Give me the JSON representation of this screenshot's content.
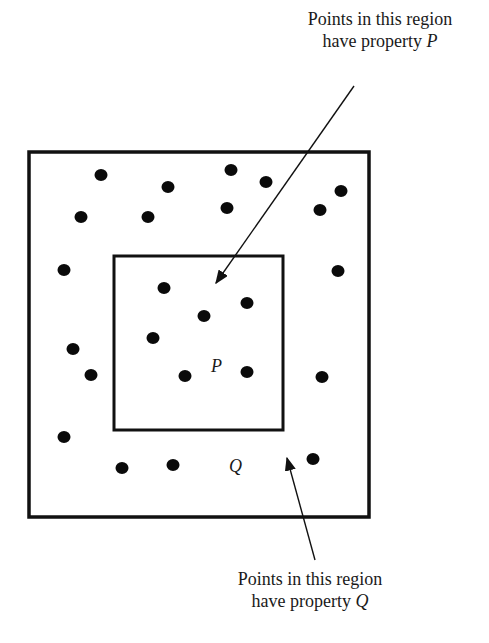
{
  "diagram": {
    "top_label": {
      "line1": "Points in this region",
      "line2_prefix": "have property ",
      "line2_var": "P"
    },
    "bottom_label": {
      "line1": "Points in this region",
      "line2_prefix": "have property ",
      "line2_var": "Q"
    },
    "inner_region_letter": "P",
    "outer_region_letter": "Q",
    "outer_box": {
      "x": 29,
      "y": 152,
      "w": 340,
      "h": 365
    },
    "inner_box": {
      "x": 114,
      "y": 256,
      "w": 169,
      "h": 174
    },
    "inner_points": [
      [
        164,
        288
      ],
      [
        204,
        316
      ],
      [
        247,
        303
      ],
      [
        153,
        338
      ],
      [
        185,
        376
      ],
      [
        247,
        372
      ]
    ],
    "outer_points": [
      [
        101,
        175
      ],
      [
        168,
        187
      ],
      [
        231,
        170
      ],
      [
        266,
        182
      ],
      [
        341,
        191
      ],
      [
        81,
        217
      ],
      [
        148,
        217
      ],
      [
        227,
        208
      ],
      [
        320,
        210
      ],
      [
        64,
        270
      ],
      [
        338,
        271
      ],
      [
        73,
        349
      ],
      [
        91,
        375
      ],
      [
        322,
        377
      ],
      [
        64,
        437
      ],
      [
        122,
        468
      ],
      [
        173,
        465
      ],
      [
        313,
        459
      ]
    ],
    "colors": {
      "line": "#111111",
      "point": "#0a0a0a",
      "background": "#ffffff"
    }
  }
}
